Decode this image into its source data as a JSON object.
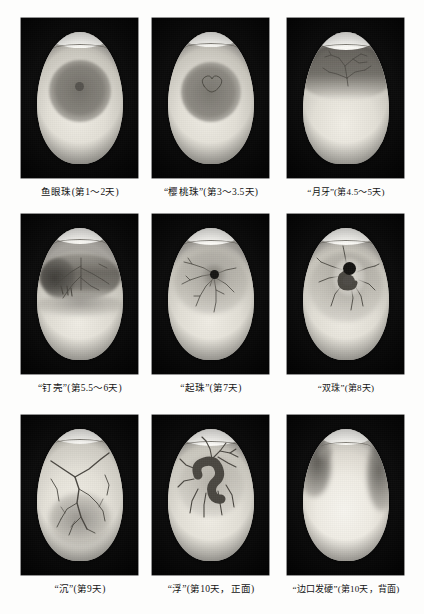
{
  "page": {
    "background_color": "#fdfdfc"
  },
  "figure": {
    "type": "photo-grid",
    "rows": 3,
    "columns": 3,
    "caption_color": "#141414"
  },
  "panels": [
    {
      "id": "panel-1",
      "stage_name": "鱼眼珠",
      "day_range": "第1～2天",
      "caption": "鱼眼珠(第1～2天)",
      "quoted": false,
      "description": "圆形深色卵黄中央有小黑点，无血管",
      "egg_tone": "#e6e3da",
      "blob_tone": "#8e8b84"
    },
    {
      "id": "panel-2",
      "stage_name": "樱桃珠",
      "day_range": "第3～3.5天",
      "caption": "“樱桃珠”(第3～3.5天)",
      "quoted": true,
      "description": "深色区中央出现樱桃形轮廓线",
      "egg_tone": "#e8e5dc",
      "blob_tone": "#918e87"
    },
    {
      "id": "panel-3",
      "stage_name": "月牙",
      "day_range": "第4.5～5天",
      "caption": "“月牙”(第4.5～5天)",
      "quoted": true,
      "description": "上部呈月牙形暗区，血管呈树枝状分布",
      "egg_tone": "#ddd9d0",
      "blob_tone": "#7e7b75"
    },
    {
      "id": "panel-4",
      "stage_name": "钉壳",
      "day_range": "第5.5～6天",
      "caption": "“钉壳”(第5.5～6天)",
      "quoted": true,
      "description": "暗区横贯蛋中部，血管向两侧延伸",
      "egg_tone": "#dbd8cf",
      "blob_tone": "#7b7872"
    },
    {
      "id": "panel-5",
      "stage_name": "起珠",
      "day_range": "第7天",
      "caption": "“起珠”(第7天)",
      "quoted": true,
      "description": "中央黑点明显，血管放射状布满蛋面",
      "egg_tone": "#dedbd2",
      "blob_tone": "#2b2a27"
    },
    {
      "id": "panel-6",
      "stage_name": "双珠",
      "day_range": "第8天",
      "caption": "“双珠”(第8天)",
      "quoted": true,
      "description": "黑点与胚体形成双珠状，血管粗大",
      "egg_tone": "#dedbd2",
      "blob_tone": "#1f1e1c"
    },
    {
      "id": "panel-7",
      "stage_name": "沉",
      "day_range": "第9天",
      "caption": "“沉”(第9天)",
      "quoted": true,
      "description": "胚体下沉，血管粗壮清晰",
      "egg_tone": "#e0ddd4",
      "blob_tone": "#6d6a65"
    },
    {
      "id": "panel-8",
      "stage_name": "浮",
      "day_range": "第10天，正面",
      "caption": "“浮”(第10天，正面)",
      "quoted": true,
      "description": "胚体上浮呈钩形暗块，正面观",
      "egg_tone": "#dcd9d0",
      "blob_tone": "#55524d"
    },
    {
      "id": "panel-9",
      "stage_name": "边口发硬",
      "day_range": "第10天，背面",
      "caption": "“边口发硬”(第10天，背面)",
      "quoted": true,
      "description": "蛋边缘发硬，背面观，大片亮区",
      "egg_tone": "#e9e6dd",
      "blob_tone": "#8c8982"
    }
  ]
}
